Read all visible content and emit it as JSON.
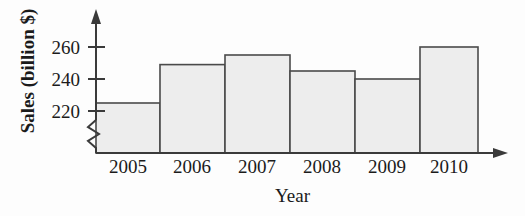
{
  "chart_data": {
    "type": "bar",
    "title": "",
    "subtitle": "",
    "xlabel": "Year",
    "ylabel": "Sales (billion $)",
    "categories": [
      "2005",
      "2006",
      "2007",
      "2008",
      "2009",
      "2010"
    ],
    "values": [
      225,
      249,
      255,
      245,
      240,
      260
    ],
    "series": [
      {
        "name": "Sales",
        "values": [
          225,
          249,
          255,
          245,
          240,
          260
        ]
      }
    ],
    "ylim": [
      215,
      268
    ],
    "y_ticks": [
      220,
      240,
      260
    ],
    "y_tick_labels": [
      "220",
      "240",
      "260"
    ],
    "axis_break": true,
    "axis_break_note": "zigzag break on y-axis below 220",
    "grid": false,
    "legend": false,
    "legend_position": "none",
    "bar_fill_color": "#ededed",
    "bar_edge_color": "#4a4a4a",
    "axis_color": "#3a3a3a",
    "text_color": "#1b1b1b",
    "background_color": "#fdfdfd",
    "bars_contiguous": true,
    "x_axis_arrow": true,
    "y_axis_arrow": true
  }
}
